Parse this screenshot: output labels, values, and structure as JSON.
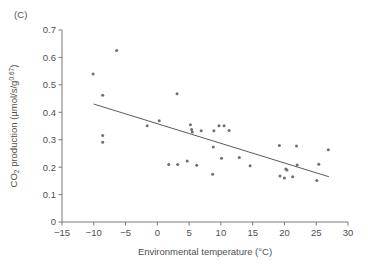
{
  "figure": {
    "panel_label": "(C)",
    "background_color": "#ffffff",
    "point_color": "#6e6e7a",
    "line_color": "#5a5a5a",
    "axis_color": "#6b6b6b",
    "text_color": "#4f4f4f"
  },
  "chart_data": {
    "type": "scatter",
    "title": "",
    "panel": "(C)",
    "xlabel": "Environmental temperature (°C)",
    "ylabel": "CO2 production (µmol/s/g0.67)",
    "ylabel_parts": {
      "prefix": "CO",
      "subscript": "2",
      "middle": " production (µmol/s/g",
      "superscript": "0.67",
      "suffix": ")"
    },
    "xlim": [
      -15,
      30
    ],
    "ylim": [
      0,
      0.7
    ],
    "xticks": [
      -15,
      -10,
      -5,
      0,
      5,
      10,
      15,
      20,
      25,
      30
    ],
    "xtick_labels": [
      "−15",
      "−10",
      "−5",
      "0",
      "5",
      "10",
      "15",
      "20",
      "25",
      "30"
    ],
    "yticks": [
      0,
      0.1,
      0.2,
      0.3,
      0.4,
      0.5,
      0.6,
      0.7
    ],
    "ytick_labels": [
      "0",
      "0.1",
      "0.2",
      "0.3",
      "0.4",
      "0.5",
      "0.6",
      "0.7"
    ],
    "grid": false,
    "legend": null,
    "x": [
      -10.1,
      -8.6,
      -8.6,
      -8.6,
      -6.4,
      -1.6,
      0.3,
      1.8,
      3.1,
      3.2,
      4.7,
      5.2,
      5.4,
      5.5,
      6.2,
      6.9,
      8.7,
      8.8,
      8.9,
      9.7,
      10.1,
      10.5,
      11.3,
      12.9,
      14.6,
      19.2,
      19.3,
      20.0,
      20.2,
      20.4,
      21.3,
      21.9,
      22.0,
      25.1,
      25.4,
      26.9
    ],
    "y": [
      0.54,
      0.462,
      0.315,
      0.291,
      0.625,
      0.351,
      0.369,
      0.21,
      0.468,
      0.21,
      0.222,
      0.355,
      0.337,
      0.328,
      0.207,
      0.333,
      0.174,
      0.273,
      0.333,
      0.351,
      0.232,
      0.351,
      0.334,
      0.235,
      0.205,
      0.279,
      0.168,
      0.16,
      0.193,
      0.19,
      0.165,
      0.277,
      0.208,
      0.151,
      0.211,
      0.263
    ],
    "points": [
      {
        "x": -10.1,
        "y": 0.54
      },
      {
        "x": -8.6,
        "y": 0.462
      },
      {
        "x": -8.6,
        "y": 0.315
      },
      {
        "x": -8.6,
        "y": 0.291
      },
      {
        "x": -6.4,
        "y": 0.625
      },
      {
        "x": -1.6,
        "y": 0.351
      },
      {
        "x": 0.3,
        "y": 0.369
      },
      {
        "x": 1.8,
        "y": 0.21
      },
      {
        "x": 3.1,
        "y": 0.468
      },
      {
        "x": 3.2,
        "y": 0.21
      },
      {
        "x": 4.7,
        "y": 0.222
      },
      {
        "x": 5.2,
        "y": 0.355
      },
      {
        "x": 5.4,
        "y": 0.337
      },
      {
        "x": 5.5,
        "y": 0.328
      },
      {
        "x": 6.2,
        "y": 0.207
      },
      {
        "x": 6.9,
        "y": 0.333
      },
      {
        "x": 8.7,
        "y": 0.174
      },
      {
        "x": 8.8,
        "y": 0.273
      },
      {
        "x": 8.9,
        "y": 0.333
      },
      {
        "x": 9.7,
        "y": 0.351
      },
      {
        "x": 10.1,
        "y": 0.232
      },
      {
        "x": 10.5,
        "y": 0.351
      },
      {
        "x": 11.3,
        "y": 0.334
      },
      {
        "x": 12.9,
        "y": 0.235
      },
      {
        "x": 14.6,
        "y": 0.205
      },
      {
        "x": 19.2,
        "y": 0.279
      },
      {
        "x": 19.3,
        "y": 0.168
      },
      {
        "x": 20.0,
        "y": 0.16
      },
      {
        "x": 20.2,
        "y": 0.193
      },
      {
        "x": 20.4,
        "y": 0.19
      },
      {
        "x": 21.3,
        "y": 0.165
      },
      {
        "x": 21.9,
        "y": 0.277
      },
      {
        "x": 22.0,
        "y": 0.208
      },
      {
        "x": 25.1,
        "y": 0.151
      },
      {
        "x": 25.4,
        "y": 0.211
      },
      {
        "x": 26.9,
        "y": 0.263
      }
    ],
    "trendline": {
      "x_start": -10.0,
      "y_start": 0.43,
      "x_end": 27.0,
      "y_end": 0.165
    }
  }
}
